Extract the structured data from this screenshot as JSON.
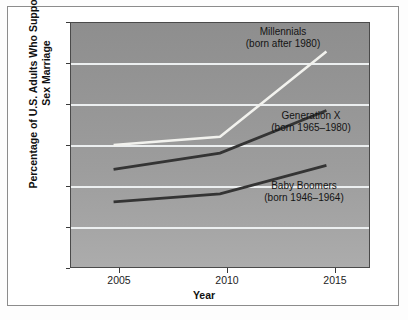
{
  "chart_data": {
    "type": "line",
    "title": "",
    "xlabel": "Year",
    "ylabel": "Percentage of U.S. Adults Who Support Same-Sex Marriage",
    "x": [
      2005,
      2010,
      2015
    ],
    "xtick_labels": [
      "2005",
      "2010",
      "2015"
    ],
    "ytick_labels": [
      "20",
      "30",
      "40",
      "50",
      "60",
      "70",
      "80"
    ],
    "yticks": [
      20,
      30,
      40,
      50,
      60,
      70,
      80
    ],
    "xlim": [
      2003,
      2017
    ],
    "ylim": [
      20,
      80
    ],
    "grid": "horizontal",
    "legend": "inline-annotations",
    "series": [
      {
        "name": "Millennials",
        "annotation_line1": "Millennials",
        "annotation_line2": "(born after 1980)",
        "color": "#f2f2ee",
        "values": [
          50,
          52,
          73
        ]
      },
      {
        "name": "Generation X",
        "annotation_line1": "Generation X",
        "annotation_line2": "(born 1965–1980)",
        "color": "#343434",
        "values": [
          44,
          48,
          58.5
        ]
      },
      {
        "name": "Baby Boomers",
        "annotation_line1": "Baby Boomers",
        "annotation_line2": "(born 1946–1964)",
        "color": "#343434",
        "values": [
          36,
          38,
          45
        ]
      }
    ]
  },
  "colors": {
    "plot_top": "#8e8e8e",
    "plot_bottom": "#acacac",
    "gridline": "#eceff0",
    "axis": "#4a4a4a",
    "page_background": "#ffffff",
    "frame_border": "#8c8c8c"
  }
}
